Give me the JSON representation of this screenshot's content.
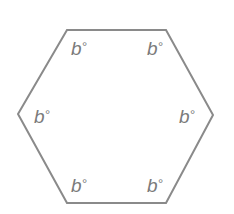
{
  "figure": {
    "background_color": "#ffffff",
    "shape": {
      "name": "hexagon",
      "sides": 6,
      "stroke_color": "#8a8a8a",
      "stroke_width": 2,
      "fill": "none",
      "points": "67,30 166,30 213,115 166,203 67,203 18,114"
    },
    "label_color": "#7a7a7a",
    "labels": [
      {
        "id": "top-left",
        "text": "b",
        "degree": "°"
      },
      {
        "id": "top-right",
        "text": "b",
        "degree": "°"
      },
      {
        "id": "mid-left",
        "text": "b",
        "degree": "°"
      },
      {
        "id": "mid-right",
        "text": "b",
        "degree": "°"
      },
      {
        "id": "bottom-left",
        "text": "b",
        "degree": "°"
      },
      {
        "id": "bottom-right",
        "text": "b",
        "degree": "°"
      }
    ]
  }
}
